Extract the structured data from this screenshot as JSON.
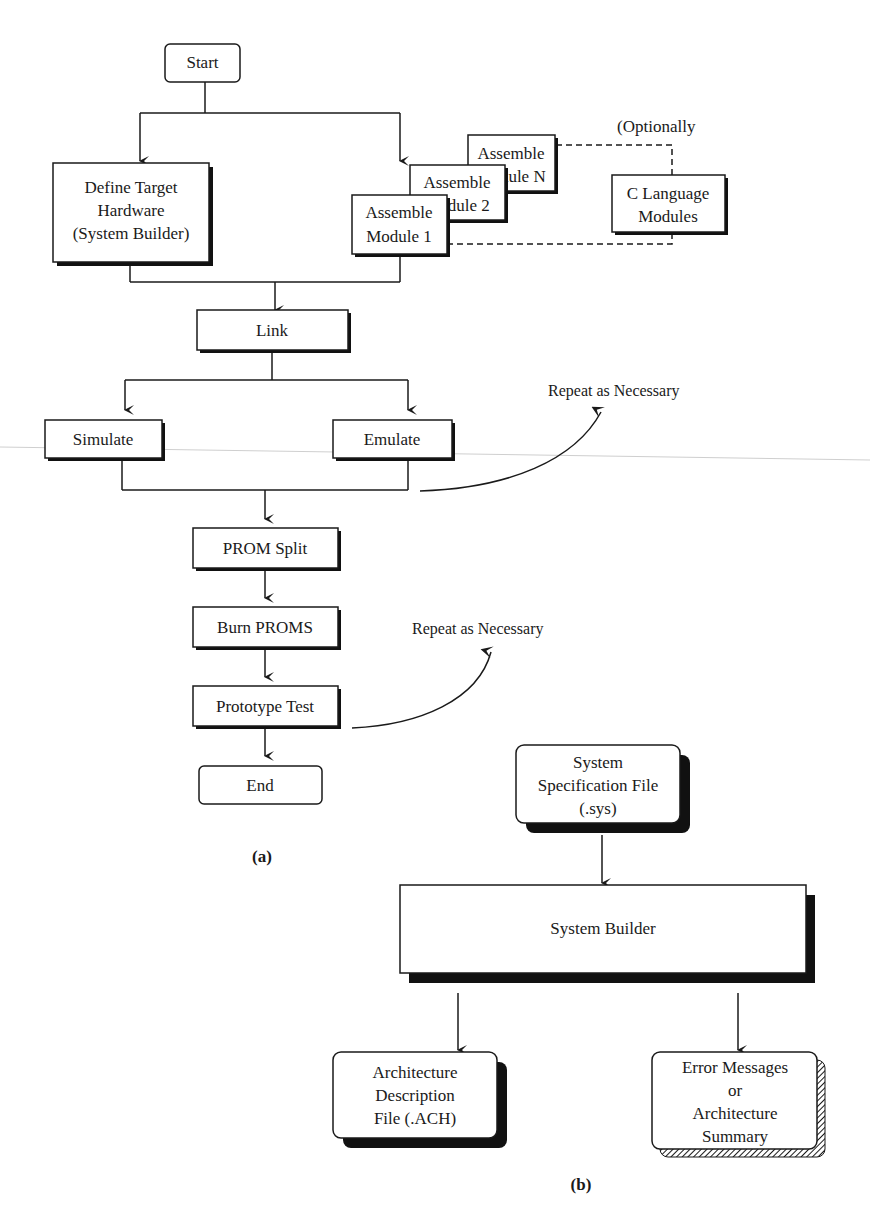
{
  "figure_a": {
    "caption": "(a)",
    "nodes": {
      "start": "Start",
      "define_target": [
        "Define Target",
        "Hardware",
        "(System Builder)"
      ],
      "assemble_n": [
        "Assemble",
        "Module N"
      ],
      "assemble_2": [
        "Assemble",
        "Module 2"
      ],
      "assemble_1": [
        "Assemble",
        "Module 1"
      ],
      "c_language": [
        "C Language",
        "Modules"
      ],
      "optionally_note": "(Optionally",
      "link": "Link",
      "simulate": "Simulate",
      "emulate": "Emulate",
      "repeat_1": "Repeat as Necessary",
      "prom_split": "PROM Split",
      "burn_proms": "Burn PROMS",
      "prototype_test": "Prototype Test",
      "repeat_2": "Repeat as Necessary",
      "end": "End"
    }
  },
  "figure_b": {
    "caption": "(b)",
    "nodes": {
      "system_spec": [
        "System",
        "Specification File",
        "(.sys)"
      ],
      "system_builder": "System Builder",
      "arch_desc": [
        "Architecture",
        "Description",
        "File (.ACH)"
      ],
      "error_msgs": [
        "Error Messages",
        "or",
        "Architecture",
        "Summary"
      ]
    }
  },
  "colors": {
    "ink": "#1a1a1a",
    "paper": "#ffffff",
    "shadow": "#111111"
  }
}
